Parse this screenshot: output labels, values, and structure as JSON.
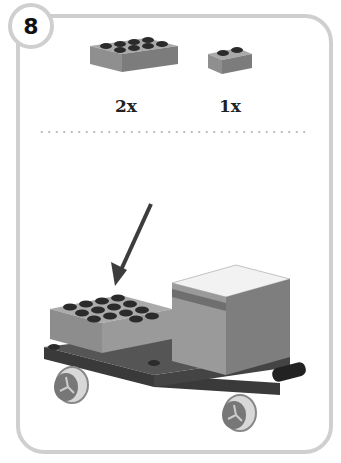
{
  "step": {
    "number": "8"
  },
  "parts": [
    {
      "name": "brick-2x4",
      "quantity": "2x"
    },
    {
      "name": "brick-1x2",
      "quantity": "1x"
    }
  ],
  "colors": {
    "frame": "#cfcfcf",
    "brick": "#8f8f8f",
    "brick_top": "#a9a9a9",
    "brick_side": "#7a7a7a",
    "dark": "#3a3a3a",
    "stud": "#2b2b2b",
    "arrow": "#3c3c3c"
  }
}
